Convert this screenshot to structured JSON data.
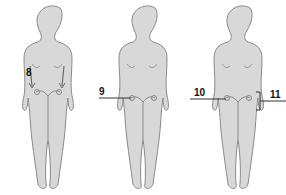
{
  "diagram": {
    "type": "anatomical-figures",
    "colors": {
      "body_fill": "#d8d8d8",
      "outline": "#8a8a8a",
      "label": "#111111",
      "background": "#ffffff"
    },
    "figures": [
      {
        "id": "figure-1",
        "labels": [
          {
            "text": "8",
            "target": "abdomen-arrows-to-ovaries"
          }
        ]
      },
      {
        "id": "figure-2",
        "labels": [
          {
            "text": "9",
            "target": "left-ovary"
          }
        ]
      },
      {
        "id": "figure-3",
        "labels": [
          {
            "text": "10",
            "target": "left-ovary"
          },
          {
            "text": "11",
            "target": "right-adnexa-bracket"
          }
        ]
      }
    ]
  }
}
